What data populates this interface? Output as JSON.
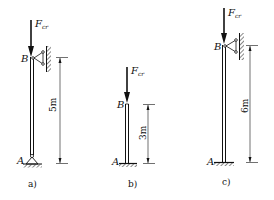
{
  "figures": [
    {
      "id": "a",
      "caption": "a)",
      "force_label": "F",
      "force_sub": "cr",
      "top_label": "B",
      "bottom_label": "A",
      "length": "5m",
      "top_support": "pin-roller to wall",
      "bottom_support": "pinned"
    },
    {
      "id": "b",
      "caption": "b)",
      "force_label": "F",
      "force_sub": "cr",
      "top_label": "B",
      "bottom_label": "A",
      "length": "3m",
      "top_support": "free",
      "bottom_support": "fixed"
    },
    {
      "id": "c",
      "caption": "c)",
      "force_label": "F",
      "force_sub": "cr",
      "top_label": "B",
      "bottom_label": "A",
      "length": "6m",
      "top_support": "pin-roller to wall",
      "bottom_support": "fixed"
    }
  ],
  "colors": {
    "line": "#111111",
    "background": "#ffffff"
  }
}
